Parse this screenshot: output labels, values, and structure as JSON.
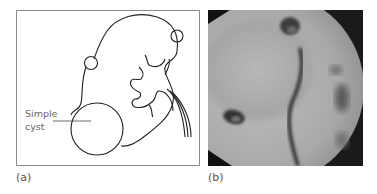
{
  "figure": {
    "panel_a": {
      "label": "(a)",
      "callout_line1": "Simple",
      "callout_line2": "cyst",
      "description": "Line diagram of a kidney with a large simple cyst at the lower pole and two small cysts"
    },
    "panel_b": {
      "label": "(b)",
      "description": "Grayscale radiograph (retrograde pyelogram) showing ureter and calyces displaced by cyst"
    }
  }
}
